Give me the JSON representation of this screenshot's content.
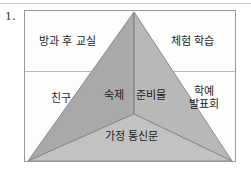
{
  "item": {
    "number": "1."
  },
  "figure": {
    "type": "pyramid-diagram",
    "colors": {
      "face_left": "#a9a9a9",
      "face_right": "#b8b8b8",
      "face_bottom": "#c2c2c2",
      "outline": "#8a8a8a",
      "box_border": "#9b9b9b",
      "divider": "#b9b9b9",
      "background": "#fdfdfd",
      "text": "#1d1d1d"
    },
    "labels": {
      "top_left": "방과 후 교실",
      "top_right": "체험 학습",
      "middle_left": "친구",
      "face_left": "숙제",
      "face_right": "준비물",
      "middle_right_line1": "학예",
      "middle_right_line2": "발표회",
      "face_bottom": "가정 통신문"
    }
  }
}
